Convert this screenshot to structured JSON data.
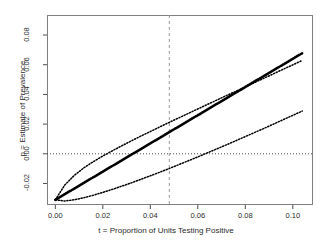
{
  "figure": {
    "background": "#ffffff",
    "panel": {
      "left": 47,
      "right": 313,
      "top": 15,
      "bottom": 205,
      "border_color": "#808080"
    }
  },
  "chart_data": {
    "type": "line",
    "title": "",
    "subtitle": "",
    "xlabel": "t = Proportion of Units Testing Positive",
    "ylabel": "p = Estimate of Prevalence",
    "xlim": [
      -0.0035,
      0.1085
    ],
    "ylim": [
      -0.0345,
      0.0935
    ],
    "xticks": [
      0.0,
      0.02,
      0.04,
      0.06,
      0.08,
      0.1
    ],
    "xticklabels": [
      "0.00",
      "0.02",
      "0.04",
      "0.06",
      "0.08",
      "0.10"
    ],
    "yticks": [
      -0.02,
      0.0,
      0.02,
      0.04,
      0.06,
      0.08
    ],
    "yticklabels": [
      "-0.02",
      "0.00",
      "0.02",
      "0.04",
      "0.06",
      "0.08"
    ],
    "grid": false,
    "legend": "none",
    "line_color": "#000000",
    "line_style": "dotted",
    "series": [
      {
        "name": "upper-confidence-bound",
        "style": "dotted",
        "color": "#000000",
        "x": [
          0.0,
          0.004,
          0.008,
          0.012,
          0.016,
          0.02,
          0.024,
          0.028,
          0.032,
          0.036,
          0.04,
          0.044,
          0.048,
          0.052,
          0.056,
          0.06,
          0.064,
          0.068,
          0.072,
          0.076,
          0.08,
          0.084,
          0.088,
          0.092,
          0.096,
          0.1,
          0.104
        ],
        "y": [
          -0.031,
          -0.021,
          -0.0145,
          -0.0095,
          -0.0053,
          -0.0015,
          0.002,
          0.0054,
          0.0087,
          0.0119,
          0.015,
          0.0181,
          0.0212,
          0.0242,
          0.0272,
          0.0302,
          0.0332,
          0.0362,
          0.0392,
          0.0421,
          0.0451,
          0.0481,
          0.051,
          0.054,
          0.057,
          0.0599,
          0.0629
        ]
      },
      {
        "name": "point-estimate",
        "style": "dotted-heavy",
        "color": "#000000",
        "x": [
          0.0,
          0.004,
          0.008,
          0.012,
          0.016,
          0.02,
          0.024,
          0.028,
          0.032,
          0.036,
          0.04,
          0.044,
          0.048,
          0.052,
          0.056,
          0.06,
          0.064,
          0.068,
          0.072,
          0.076,
          0.08,
          0.084,
          0.088,
          0.092,
          0.096,
          0.1,
          0.104
        ],
        "y": [
          -0.031,
          -0.0272,
          -0.0234,
          -0.0196,
          -0.0158,
          -0.012,
          -0.0082,
          -0.0044,
          -0.0006,
          0.0032,
          0.007,
          0.0108,
          0.0146,
          0.0184,
          0.0222,
          0.026,
          0.0298,
          0.0336,
          0.0374,
          0.0412,
          0.045,
          0.0488,
          0.0526,
          0.0564,
          0.0602,
          0.064,
          0.0678
        ]
      },
      {
        "name": "lower-confidence-bound",
        "style": "dotted",
        "color": "#000000",
        "x": [
          0.0,
          0.004,
          0.008,
          0.012,
          0.016,
          0.02,
          0.024,
          0.028,
          0.032,
          0.036,
          0.04,
          0.044,
          0.048,
          0.052,
          0.056,
          0.06,
          0.064,
          0.068,
          0.072,
          0.076,
          0.08,
          0.084,
          0.088,
          0.092,
          0.096,
          0.1,
          0.104
        ],
        "y": [
          -0.031,
          -0.0318,
          -0.031,
          -0.0296,
          -0.0279,
          -0.026,
          -0.024,
          -0.0218,
          -0.0196,
          -0.0172,
          -0.0148,
          -0.0124,
          -0.0099,
          -0.0073,
          -0.0047,
          -0.0021,
          0.0006,
          0.0033,
          0.006,
          0.0088,
          0.0116,
          0.0144,
          0.0172,
          0.0201,
          0.023,
          0.0259,
          0.0288
        ]
      }
    ],
    "annotations": [
      {
        "name": "zero-reference-line",
        "orientation": "horizontal",
        "value": 0.0,
        "style": "dotted",
        "color": "#4d4d4d"
      },
      {
        "name": "observed-proportion-line",
        "orientation": "vertical",
        "value": 0.048,
        "style": "dashed",
        "color": "#999999"
      }
    ]
  }
}
